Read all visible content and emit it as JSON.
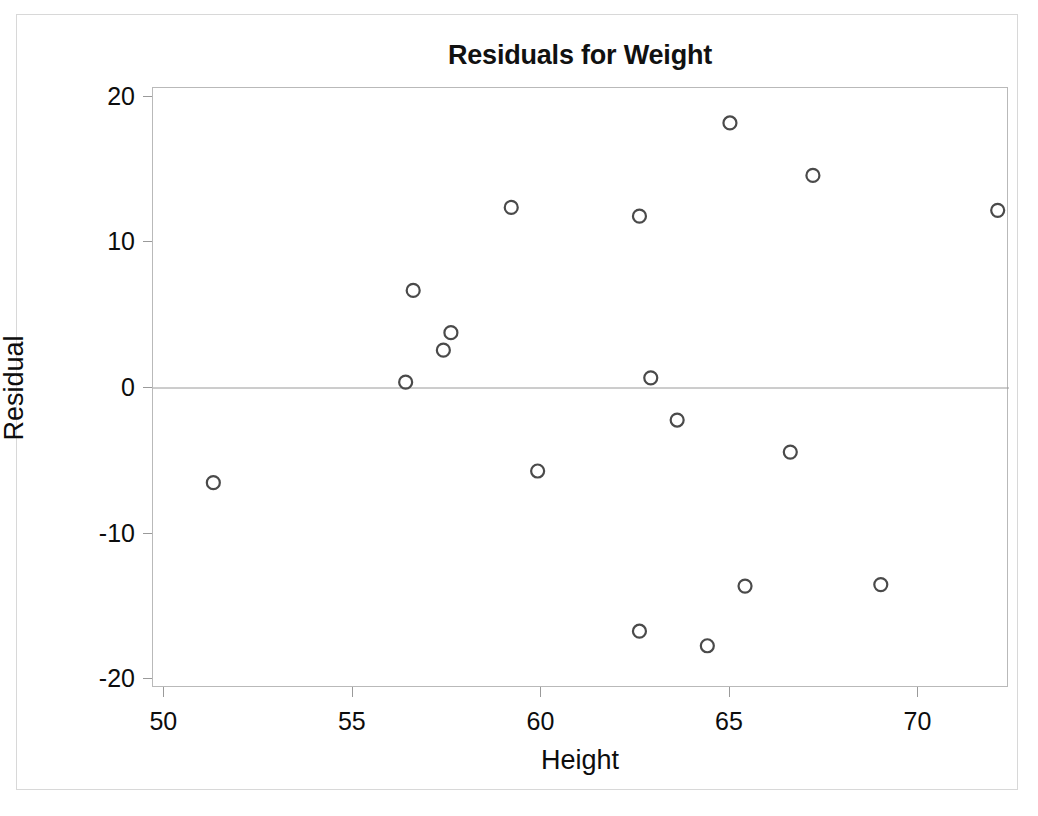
{
  "chart_data": {
    "type": "scatter",
    "title": "Residuals for Weight",
    "xlabel": "Height",
    "ylabel": "Residual",
    "xlim": [
      49.7,
      72.4
    ],
    "ylim": [
      -20.6,
      20.6
    ],
    "xticks": [
      50,
      55,
      60,
      65,
      70
    ],
    "yticks": [
      20,
      10,
      0,
      -10,
      -20
    ],
    "xtick_labels": [
      "50",
      "55",
      "60",
      "65",
      "70"
    ],
    "ytick_labels": [
      "20",
      "10",
      "0",
      "-10",
      "-20"
    ],
    "grid": false,
    "legend": "none",
    "reference_line": {
      "axis": "y",
      "value": 0,
      "color": "#9a9a9a"
    },
    "marker": {
      "shape": "open-circle",
      "size": 13,
      "edge_color": "#4a4a4a",
      "fill": "none"
    },
    "x": [
      51.3,
      56.4,
      56.6,
      57.4,
      57.6,
      59.2,
      59.9,
      62.6,
      62.6,
      62.9,
      63.6,
      64.4,
      65.0,
      65.4,
      66.6,
      67.2,
      69.0,
      72.1
    ],
    "y": [
      -6.5,
      0.4,
      6.7,
      2.6,
      3.8,
      12.4,
      -5.7,
      11.8,
      -16.7,
      0.7,
      -2.2,
      -17.7,
      18.2,
      -13.6,
      -4.4,
      14.6,
      -13.5,
      12.2
    ],
    "points": [
      {
        "x": 51.3,
        "y": -6.5
      },
      {
        "x": 56.4,
        "y": 0.4
      },
      {
        "x": 56.6,
        "y": 6.7
      },
      {
        "x": 57.4,
        "y": 2.6
      },
      {
        "x": 57.6,
        "y": 3.8
      },
      {
        "x": 59.2,
        "y": 12.4
      },
      {
        "x": 59.9,
        "y": -5.7
      },
      {
        "x": 62.6,
        "y": 11.8
      },
      {
        "x": 62.6,
        "y": -16.7
      },
      {
        "x": 62.9,
        "y": 0.7
      },
      {
        "x": 63.6,
        "y": -2.2
      },
      {
        "x": 64.4,
        "y": -17.7
      },
      {
        "x": 65.0,
        "y": 18.2
      },
      {
        "x": 65.4,
        "y": -13.6
      },
      {
        "x": 66.6,
        "y": -4.4
      },
      {
        "x": 67.2,
        "y": 14.6
      },
      {
        "x": 69.0,
        "y": -13.5
      },
      {
        "x": 72.1,
        "y": 12.2
      }
    ]
  },
  "colors": {
    "background": "#ffffff",
    "frame": "#b9b9b9",
    "marker_edge": "#4a4a4a",
    "text": "#0d0d0d",
    "zero_line": "#9a9a9a"
  }
}
